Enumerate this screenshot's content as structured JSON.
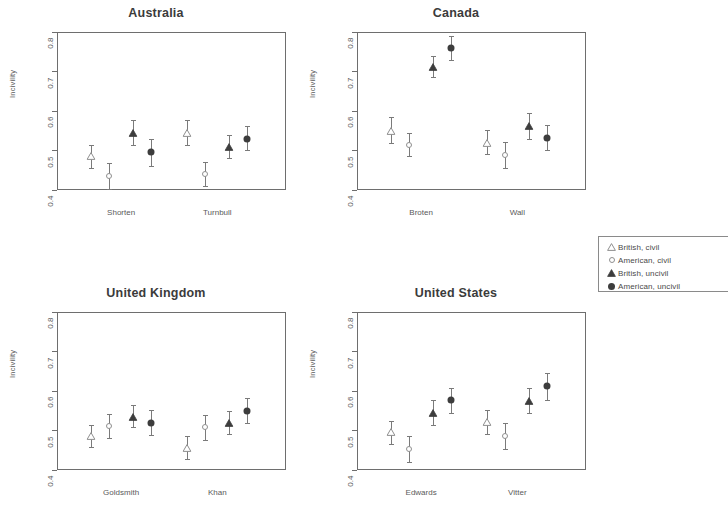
{
  "chart_data": [
    {
      "type": "scatter",
      "title": "Australia",
      "xlabel": "",
      "ylabel": "Incivility",
      "ylim": [
        0.4,
        0.8
      ],
      "yticks": [
        "0.4",
        "0.5",
        "0.6",
        "0.7",
        "0.8"
      ],
      "grid": false,
      "legend_position": "right",
      "categories": [
        "Shorten",
        "Turnbull"
      ],
      "series": [
        {
          "name": "British, civil",
          "marker": "triangle-open",
          "values": [
            0.485,
            0.545
          ],
          "lower": [
            0.455,
            0.515
          ],
          "upper": [
            0.515,
            0.578
          ]
        },
        {
          "name": "American, civil",
          "marker": "circle-open",
          "values": [
            0.435,
            0.44
          ],
          "lower": [
            0.402,
            0.41
          ],
          "upper": [
            0.468,
            0.472
          ]
        },
        {
          "name": "British, uncivil",
          "marker": "triangle-fill",
          "values": [
            0.545,
            0.51
          ],
          "lower": [
            0.515,
            0.482
          ],
          "upper": [
            0.578,
            0.54
          ]
        },
        {
          "name": "American, uncivil",
          "marker": "circle-fill",
          "values": [
            0.495,
            0.53
          ],
          "lower": [
            0.462,
            0.5
          ],
          "upper": [
            0.528,
            0.562
          ]
        }
      ]
    },
    {
      "type": "scatter",
      "title": "Canada",
      "xlabel": "",
      "ylabel": "Incivility",
      "ylim": [
        0.4,
        0.8
      ],
      "yticks": [
        "0.4",
        "0.5",
        "0.6",
        "0.7",
        "0.8"
      ],
      "grid": false,
      "legend_position": "right",
      "categories": [
        "Broten",
        "Wall"
      ],
      "series": [
        {
          "name": "British, civil",
          "marker": "triangle-open",
          "values": [
            0.55,
            0.52
          ],
          "lower": [
            0.518,
            0.49
          ],
          "upper": [
            0.585,
            0.552
          ]
        },
        {
          "name": "American, civil",
          "marker": "circle-open",
          "values": [
            0.515,
            0.488
          ],
          "lower": [
            0.487,
            0.455
          ],
          "upper": [
            0.545,
            0.522
          ]
        },
        {
          "name": "British, uncivil",
          "marker": "triangle-fill",
          "values": [
            0.712,
            0.562
          ],
          "lower": [
            0.685,
            0.528
          ],
          "upper": [
            0.738,
            0.595
          ]
        },
        {
          "name": "American, uncivil",
          "marker": "circle-fill",
          "values": [
            0.76,
            0.532
          ],
          "lower": [
            0.728,
            0.5
          ],
          "upper": [
            0.79,
            0.565
          ]
        }
      ]
    },
    {
      "type": "scatter",
      "title": "United Kingdom",
      "xlabel": "",
      "ylabel": "Incivility",
      "ylim": [
        0.4,
        0.8
      ],
      "yticks": [
        "0.4",
        "0.5",
        "0.6",
        "0.7",
        "0.8"
      ],
      "grid": false,
      "legend_position": "right",
      "categories": [
        "Goldsmith",
        "Khan"
      ],
      "series": [
        {
          "name": "British, civil",
          "marker": "triangle-open",
          "values": [
            0.485,
            0.455
          ],
          "lower": [
            0.458,
            0.428
          ],
          "upper": [
            0.515,
            0.485
          ]
        },
        {
          "name": "American, civil",
          "marker": "circle-open",
          "values": [
            0.512,
            0.508
          ],
          "lower": [
            0.48,
            0.475
          ],
          "upper": [
            0.542,
            0.54
          ]
        },
        {
          "name": "British, uncivil",
          "marker": "triangle-fill",
          "values": [
            0.535,
            0.52
          ],
          "lower": [
            0.508,
            0.49
          ],
          "upper": [
            0.565,
            0.55
          ]
        },
        {
          "name": "American, uncivil",
          "marker": "circle-fill",
          "values": [
            0.52,
            0.55
          ],
          "lower": [
            0.488,
            0.518
          ],
          "upper": [
            0.552,
            0.582
          ]
        }
      ]
    },
    {
      "type": "scatter",
      "title": "United States",
      "xlabel": "",
      "ylabel": "Incivility",
      "ylim": [
        0.4,
        0.8
      ],
      "yticks": [
        "0.4",
        "0.5",
        "0.6",
        "0.7",
        "0.8"
      ],
      "grid": false,
      "legend_position": "right",
      "categories": [
        "Edwards",
        "Vitter"
      ],
      "series": [
        {
          "name": "British, civil",
          "marker": "triangle-open",
          "values": [
            0.495,
            0.522
          ],
          "lower": [
            0.465,
            0.492
          ],
          "upper": [
            0.525,
            0.552
          ]
        },
        {
          "name": "American, civil",
          "marker": "circle-open",
          "values": [
            0.452,
            0.485
          ],
          "lower": [
            0.42,
            0.452
          ],
          "upper": [
            0.485,
            0.518
          ]
        },
        {
          "name": "British, uncivil",
          "marker": "triangle-fill",
          "values": [
            0.545,
            0.575
          ],
          "lower": [
            0.515,
            0.545
          ],
          "upper": [
            0.578,
            0.608
          ]
        },
        {
          "name": "American, uncivil",
          "marker": "circle-fill",
          "values": [
            0.578,
            0.612
          ],
          "lower": [
            0.545,
            0.578
          ],
          "upper": [
            0.608,
            0.645
          ]
        }
      ]
    }
  ],
  "legend": {
    "entries": [
      {
        "label": "British, civil",
        "marker": "triangle-open"
      },
      {
        "label": "American, civil",
        "marker": "circle-open"
      },
      {
        "label": "British, uncivil",
        "marker": "triangle-fill"
      },
      {
        "label": "American, uncivil",
        "marker": "circle-fill"
      }
    ]
  },
  "colors": {
    "axis": "#6e6e6e",
    "text": "#4a4a4a",
    "marker_open": "#8f8f8f",
    "marker_fill": "#3d3d3d",
    "errorbar": "#7a7a7a"
  }
}
